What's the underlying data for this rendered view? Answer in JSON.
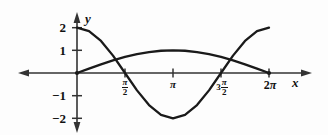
{
  "figure": {
    "background_color": "#fdfdfd",
    "curve_color": "#1a1a1a",
    "axis_color": "#333333"
  },
  "axes": {
    "x_axis_name": "x",
    "y_axis_name": "y",
    "x_ticks": [
      {
        "label_lead": "",
        "label_num": "π",
        "label_den": "2",
        "value": 1.5708,
        "type": "fraction"
      },
      {
        "label_lead": "",
        "label_num": "π",
        "label_den": "",
        "value": 3.1416,
        "type": "plain"
      },
      {
        "label_lead": "3",
        "label_num": "π",
        "label_den": "2",
        "value": 4.7124,
        "type": "fraction"
      },
      {
        "label_lead": "2",
        "label_num": "π",
        "label_den": "",
        "value": 6.2832,
        "type": "plain"
      }
    ],
    "y_ticks": [
      {
        "label": "2",
        "value": 2
      },
      {
        "label": "1",
        "value": 1
      },
      {
        "label": "−1",
        "value": -1
      },
      {
        "label": "−2",
        "value": -2
      }
    ]
  },
  "labels": {
    "y2": "2",
    "y1": "1",
    "ym1": "−1",
    "ym2": "−2",
    "pi_over_2_num": "π",
    "pi_over_2_den": "2",
    "pi": "π",
    "three_pi_over_2_lead": "3",
    "three_pi_over_2_num": "π",
    "three_pi_over_2_den": "2",
    "two_pi_lead": "2",
    "two_pi_sym": "π",
    "x_name": "x",
    "y_name": "y"
  },
  "chart_data": {
    "type": "line",
    "title": "",
    "xlabel": "x",
    "ylabel": "y",
    "xlim": [
      0,
      6.2832
    ],
    "ylim": [
      -2.3,
      2.3
    ],
    "grid": false,
    "legend": false,
    "x_tick_labels": [
      "π/2",
      "π",
      "3π/2",
      "2π"
    ],
    "x_tick_values": [
      1.5708,
      3.1416,
      4.7124,
      6.2832
    ],
    "y_tick_labels": [
      "2",
      "1",
      "−1",
      "−2"
    ],
    "y_tick_values": [
      2,
      1,
      -1,
      -2
    ],
    "series": [
      {
        "name": "y = 2 cos(x)",
        "expression": "2*cos(x)",
        "amplitude": 2,
        "period": 6.2832,
        "x": [
          0,
          0.3927,
          0.7854,
          1.1781,
          1.5708,
          1.9635,
          2.3562,
          2.7489,
          3.1416,
          3.5343,
          3.927,
          4.3197,
          4.7124,
          5.1051,
          5.4978,
          5.8905,
          6.2832
        ],
        "values": [
          2,
          1.8478,
          1.4142,
          0.7654,
          0,
          -0.7654,
          -1.4142,
          -1.8478,
          -2,
          -1.8478,
          -1.4142,
          -0.7654,
          0,
          0.7654,
          1.4142,
          1.8478,
          2
        ]
      },
      {
        "name": "y = sin(x/2)",
        "expression": "sin(x/2)",
        "amplitude": 1,
        "period": 12.5664,
        "x": [
          0,
          0.3927,
          0.7854,
          1.1781,
          1.5708,
          1.9635,
          2.3562,
          2.7489,
          3.1416,
          3.5343,
          3.927,
          4.3197,
          4.7124,
          5.1051,
          5.4978,
          5.8905,
          6.2832
        ],
        "values": [
          0,
          0.1951,
          0.3827,
          0.5556,
          0.7071,
          0.8315,
          0.9239,
          0.9808,
          1,
          0.9808,
          0.9239,
          0.8315,
          0.7071,
          0.5556,
          0.3827,
          0.1951,
          0
        ]
      }
    ],
    "intersections": [
      {
        "x": 1.0472,
        "y": 0.5
      },
      {
        "x": 5.236,
        "y": 0.5
      }
    ]
  }
}
